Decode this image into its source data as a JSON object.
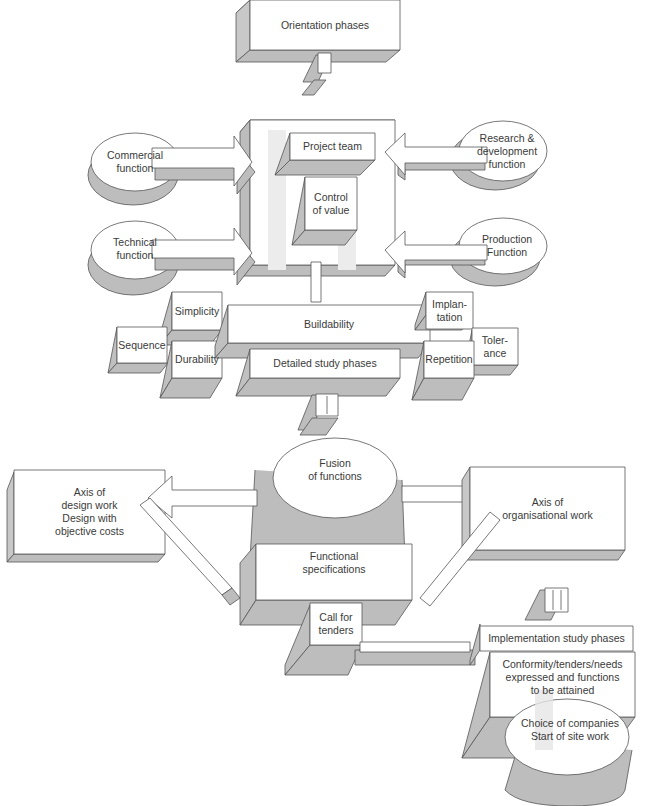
{
  "diagram": {
    "colors": {
      "face": "#ffffff",
      "side": "#bdbdbd",
      "bottom": "#c4c4c4",
      "line": "#555555",
      "highlight": "#e2e2e2"
    },
    "orientation": {
      "title": "Orientation phases",
      "numeral": "I"
    },
    "inputs": {
      "commercial": "Commercial\nfunction",
      "technical": "Technical\nfunction",
      "research": "Research &\ndevelopment\nfunction",
      "production": "Production\nFunction"
    },
    "core": {
      "project_team": "Project team",
      "control_value": "Control\nof value"
    },
    "detailed": {
      "simplicity": "Simplicity",
      "sequence": "Sequence",
      "durability": "Durability",
      "buildability": "Buildability",
      "detailed_phases": "Detailed study phases",
      "implantation": "Implan-\ntation",
      "tolerance": "Toler-\nance",
      "repetition": "Repetition",
      "numeral": "II"
    },
    "fusion": {
      "fusion": "Fusion\nof functions",
      "design_axis": "Axis of\ndesign work\nDesign with\nobjective costs",
      "org_axis": "Axis of\norganisational work",
      "func_spec": "Functional\nspecifications",
      "call_tenders": "Call for\ntenders"
    },
    "implementation": {
      "numeral": "III",
      "phases": "Implementation study phases",
      "conformity": "Conformity/tenders/needs\nexpressed and functions\nto be attained",
      "choice": "Choice of companies\nStart of site work"
    }
  }
}
